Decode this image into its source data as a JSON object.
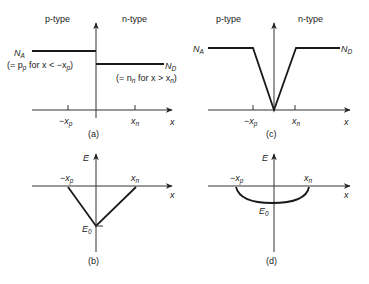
{
  "panels": {
    "a": {
      "caption": "(a)",
      "left_label": "p-type",
      "right_label": "n-type",
      "na_label": "N",
      "na_sub": "A",
      "nd_label": "N",
      "nd_sub": "D",
      "note_left": "(= p",
      "note_left_sub": "p",
      "note_left_rest": " for x < −x",
      "note_left_sub2": "p",
      "note_left_end": ")",
      "note_right": "(= n",
      "note_right_sub": "n",
      "note_right_rest": " for x > x",
      "note_right_sub2": "n",
      "note_right_end": ")",
      "tick_left": "−x",
      "tick_left_sub": "p",
      "tick_right": "x",
      "tick_right_sub": "n",
      "axis_x": "x"
    },
    "b": {
      "caption": "(b)",
      "axis_y": "E",
      "axis_x": "x",
      "tick_left": "−x",
      "tick_left_sub": "p",
      "tick_right": "x",
      "tick_right_sub": "n",
      "min_label": "E",
      "min_sub": "0"
    },
    "c": {
      "caption": "(c)",
      "left_label": "p-type",
      "right_label": "n-type",
      "na_label": "N",
      "na_sub": "A",
      "nd_label": "N",
      "nd_sub": "D",
      "tick_left": "−x",
      "tick_left_sub": "p",
      "tick_right": "x",
      "tick_right_sub": "n",
      "axis_x": "x"
    },
    "d": {
      "caption": "(d)",
      "axis_y": "E",
      "axis_x": "x",
      "tick_left": "−x",
      "tick_left_sub": "p",
      "tick_right": "x",
      "tick_right_sub": "n",
      "min_label": "E",
      "min_sub": "0"
    }
  },
  "colors": {
    "line": "#1a1a1a",
    "axis": "#333333",
    "text": "#222222"
  }
}
